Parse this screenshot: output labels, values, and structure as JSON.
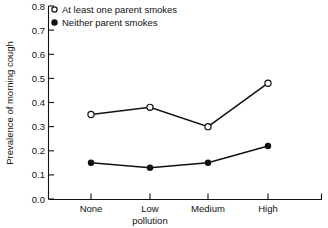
{
  "chart_data": {
    "type": "line",
    "title": "",
    "xlabel": "pollution",
    "ylabel": "Prevalence of morning cough",
    "categories": [
      "None",
      "Low",
      "Medium",
      "High"
    ],
    "ylim": [
      0.0,
      0.8
    ],
    "yticks": [
      "0.0",
      "0.1",
      "0.2",
      "0.3",
      "0.4",
      "0.5",
      "0.6",
      "0.7",
      "0.8"
    ],
    "ytick_values": [
      0.0,
      0.1,
      0.2,
      0.3,
      0.4,
      0.5,
      0.6,
      0.7,
      0.8
    ],
    "grid": false,
    "legend_position": "top-left",
    "series": [
      {
        "name": "At least one parent smokes",
        "marker": "open-circle",
        "values": [
          0.35,
          0.38,
          0.3,
          0.48
        ]
      },
      {
        "name": "Neither parent smokes",
        "marker": "filled-circle",
        "values": [
          0.15,
          0.13,
          0.15,
          0.22
        ]
      }
    ]
  },
  "axes": {
    "y_title": "Prevalence of morning cough",
    "x_title": "pollution",
    "y_tick_labels": [
      "0.8",
      "0.7",
      "0.6",
      "0.5",
      "0.4",
      "0.3",
      "0.2",
      "0.1",
      "0.0"
    ],
    "x_tick_labels": [
      "None",
      "Low",
      "Medium",
      "High"
    ]
  },
  "legend": {
    "items": [
      {
        "label": "At least one parent smokes",
        "marker": "open-circle"
      },
      {
        "label": "Neither parent smokes",
        "marker": "filled-circle"
      }
    ]
  },
  "colors": {
    "ink": "#111111",
    "background": "#ffffff"
  }
}
